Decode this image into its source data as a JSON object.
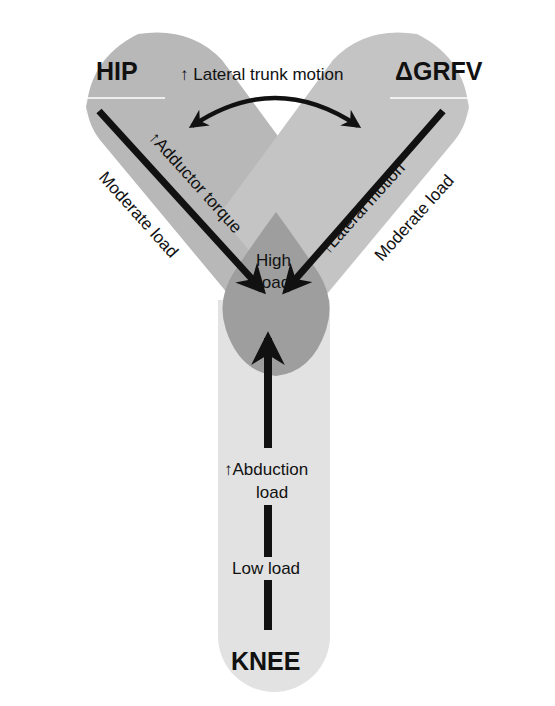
{
  "diagram": {
    "top_annotation": "↑ Lateral trunk motion",
    "nodes": {
      "hip": {
        "title": "HIP",
        "load_label": "Moderate load",
        "mechanism": "↑Adductor torque"
      },
      "grfv": {
        "title": "ΔGRFV",
        "load_label": "Moderate load",
        "mechanism": "↑Lateral motion"
      },
      "knee": {
        "title": "KNEE",
        "mechanism_line1": "↑Abduction",
        "mechanism_line2": "load",
        "load_label": "Low load"
      },
      "center": {
        "line1": "High",
        "line2": "load"
      }
    },
    "colors": {
      "limb_dark": "#b4b4b4",
      "limb_light": "#d9d9d9",
      "knee_limb": "#e2e2e2",
      "high_load": "#9c9c9c",
      "arrow": "#111111",
      "background": "#ffffff"
    }
  }
}
